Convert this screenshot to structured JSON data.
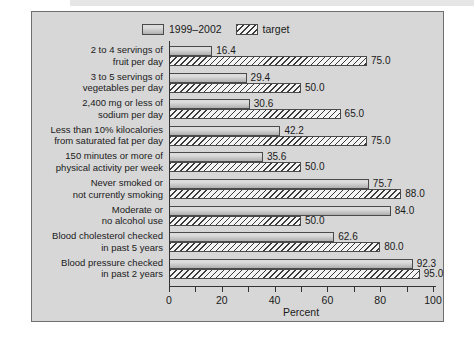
{
  "chart_data": {
    "type": "bar",
    "orientation": "horizontal",
    "xlabel": "Percent",
    "xlim": [
      0,
      100
    ],
    "xticks": [
      0,
      20,
      40,
      60,
      80,
      100
    ],
    "xticks_minor": [
      10,
      30,
      50,
      70,
      90
    ],
    "grid": false,
    "legend_position": "top",
    "value_labels": true,
    "categories": [
      [
        "2 to 4 servings of",
        "fruit per day"
      ],
      [
        "3 to 5 servings of",
        "vegetables per day"
      ],
      [
        "2,400 mg or less of",
        "sodium per day"
      ],
      [
        "Less than 10% kilocalories",
        "from saturated fat per day"
      ],
      [
        "150 minutes or more of",
        "physical activity per week"
      ],
      [
        "Never smoked or",
        "not currently smoking"
      ],
      [
        "Moderate or",
        "no alcohol use"
      ],
      [
        "Blood cholesterol checked",
        "in past 5 years"
      ],
      [
        "Blood pressure checked",
        "in past 2 years"
      ]
    ],
    "series": [
      {
        "name": "1999–2002",
        "pattern": "solid-gray",
        "values": [
          16.4,
          29.4,
          30.6,
          42.2,
          35.6,
          75.7,
          84.0,
          62.6,
          92.3
        ]
      },
      {
        "name": "target",
        "pattern": "hatched",
        "values": [
          75.0,
          50.0,
          65.0,
          75.0,
          50.0,
          88.0,
          50.0,
          80.0,
          95.0
        ]
      }
    ],
    "colors": {
      "panel_background": "#d7d7d7",
      "panel_border": "#6f6f6f",
      "bar_solid": "#b8b8b8",
      "bar_hatched_base": "#f4f4f4",
      "hatch_line": "#3a3a3a",
      "axis": "#333333",
      "text": "#1a1a1a"
    }
  }
}
